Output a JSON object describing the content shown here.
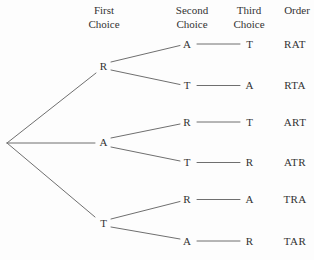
{
  "diagram": {
    "kind": "permutation-tree",
    "letters": [
      "R",
      "A",
      "T"
    ]
  },
  "colors": {
    "background": "#fdfdfd",
    "text": "#333333",
    "line": "#6f6f6f"
  },
  "headers": [
    {
      "line1": "First",
      "line2": "Choice"
    },
    {
      "line1": "Second",
      "line2": "Choice"
    },
    {
      "line1": "Third",
      "line2": "Choice"
    },
    {
      "line1": "Order",
      "line2": ""
    }
  ],
  "tree": {
    "root_branches": [
      {
        "first": "R",
        "paths": [
          {
            "second": "A",
            "third": "T",
            "order": "RAT"
          },
          {
            "second": "T",
            "third": "A",
            "order": "RTA"
          }
        ]
      },
      {
        "first": "A",
        "paths": [
          {
            "second": "R",
            "third": "T",
            "order": "ART"
          },
          {
            "second": "T",
            "third": "R",
            "order": "ATR"
          }
        ]
      },
      {
        "first": "T",
        "paths": [
          {
            "second": "R",
            "third": "A",
            "order": "TRA"
          },
          {
            "second": "A",
            "third": "R",
            "order": "TAR"
          }
        ]
      }
    ]
  }
}
